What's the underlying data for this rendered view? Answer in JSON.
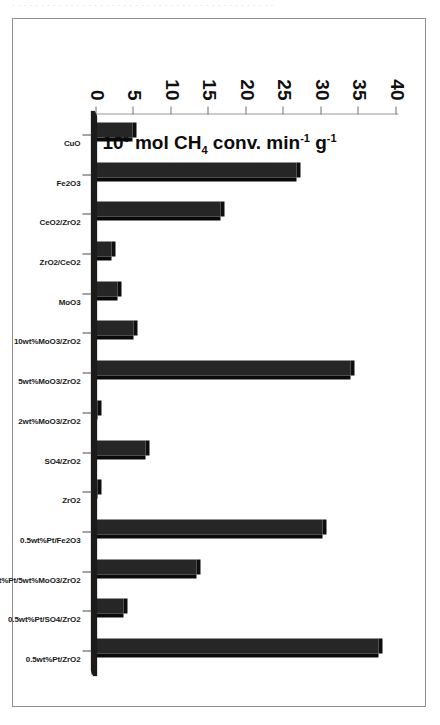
{
  "page": {
    "scan_header": "· · · · · · · · · · · · · · · · · · · · · · · · · · · · · · · · · · · · · · · · · · · · ·"
  },
  "axis_title": {
    "prefix": "10",
    "exp": "6",
    "mid": " mol CH",
    "sub": "4",
    "conv": " conv. min",
    "exp2": "-1",
    "g": " g",
    "exp3": "-1"
  },
  "chart_data": {
    "type": "bar",
    "title": "",
    "xlabel": "",
    "ylabel": "10^6 mol CH4 conv. min^-1 g^-1",
    "ylim": [
      0,
      40
    ],
    "ytick_values": [
      0,
      5,
      10,
      15,
      20,
      25,
      30,
      35,
      40
    ],
    "ytick_labels": [
      "0",
      "5",
      "10",
      "15",
      "20",
      "25",
      "30",
      "35",
      "40"
    ],
    "grid": false,
    "legend": "none",
    "orientation": "rotated-90-on-page",
    "bar_color": "#262626",
    "categories": [
      "CuO",
      "Fe2O3",
      "CeO2/ZrO2",
      "ZrO2/CeO2",
      "MoO3",
      "10wt%MoO3/ZrO2",
      "5wt%MoO3/ZrO2",
      "2wt%MoO3/ZrO2",
      "SO4/ZrO2",
      "ZrO2",
      "0.5wt%Pt/Fe2O3",
      "0.5wt%Pt/5wt%MoO3/ZrO2",
      "0.5wt%Pt/SO4/ZrO2",
      "0.5wt%Pt/ZrO2"
    ],
    "values": [
      4.8,
      26.7,
      16.5,
      2.0,
      2.8,
      5.0,
      33.9,
      0.2,
      6.6,
      0.1,
      30.1,
      13.4,
      3.6,
      37.6
    ]
  }
}
